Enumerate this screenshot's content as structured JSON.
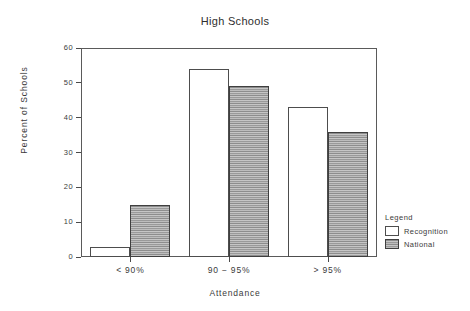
{
  "chart_data": {
    "type": "bar",
    "title": "High Schools",
    "xlabel": "Attendance",
    "ylabel": "Percent of Schools",
    "categories": [
      "< 90%",
      "90 − 95%",
      "> 95%"
    ],
    "series": [
      {
        "name": "Recognition",
        "values": [
          3,
          54,
          43
        ],
        "fill": "white",
        "color": "#ffffff"
      },
      {
        "name": "National",
        "values": [
          15,
          49,
          36
        ],
        "fill": "hatched-gray",
        "color": "#a9a9a9"
      }
    ],
    "ylim": [
      0,
      60
    ],
    "yticks": [
      0,
      10,
      20,
      30,
      40,
      50,
      60
    ],
    "ytick_labels": [
      "0",
      "10",
      "20",
      "30",
      "40",
      "50",
      "60"
    ],
    "grid": false,
    "legend": {
      "title": "Legend",
      "position": "outside-right-bottom",
      "entries": [
        "Recognition",
        "National"
      ]
    }
  }
}
